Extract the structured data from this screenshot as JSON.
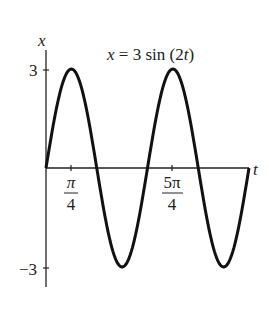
{
  "chart_data": {
    "type": "line",
    "title": "x = 3 sin (2t)",
    "xlabel": "t",
    "ylabel": "x",
    "function": "x = 3 sin(2t)",
    "x_range": [
      0,
      6.2832
    ],
    "ylim": [
      -3,
      3
    ],
    "grid": false,
    "legend": "none",
    "x_ticks": [
      {
        "value": 0.7854,
        "num": "π",
        "den": "4"
      },
      {
        "value": 3.927,
        "num": "5π",
        "den": "4"
      }
    ],
    "y_ticks": [
      {
        "value": 3,
        "label": "3"
      },
      {
        "value": -3,
        "label": "−3"
      }
    ],
    "x": [
      0,
      0.3927,
      0.7854,
      1.1781,
      1.5708,
      1.9635,
      2.3562,
      2.7489,
      3.1416,
      3.5343,
      3.927,
      4.3197,
      4.7124,
      5.1051,
      5.4978,
      5.8905,
      6.2832
    ],
    "y": [
      0,
      2.12,
      3,
      2.12,
      0,
      -2.12,
      -3,
      -2.12,
      0,
      2.12,
      3,
      2.12,
      0,
      -2.12,
      -3,
      -2.12,
      0
    ]
  },
  "labels": {
    "title_x": "x",
    "title_eq": "= 3 sin (2",
    "title_t": "t",
    "title_close": ")",
    "axis_x": "x",
    "axis_t": "t",
    "tick_y_top": "3",
    "tick_y_bottom": "−3",
    "tick_x1_num": "π",
    "tick_x1_den": "4",
    "tick_x2_num": "5π",
    "tick_x2_den": "4"
  }
}
